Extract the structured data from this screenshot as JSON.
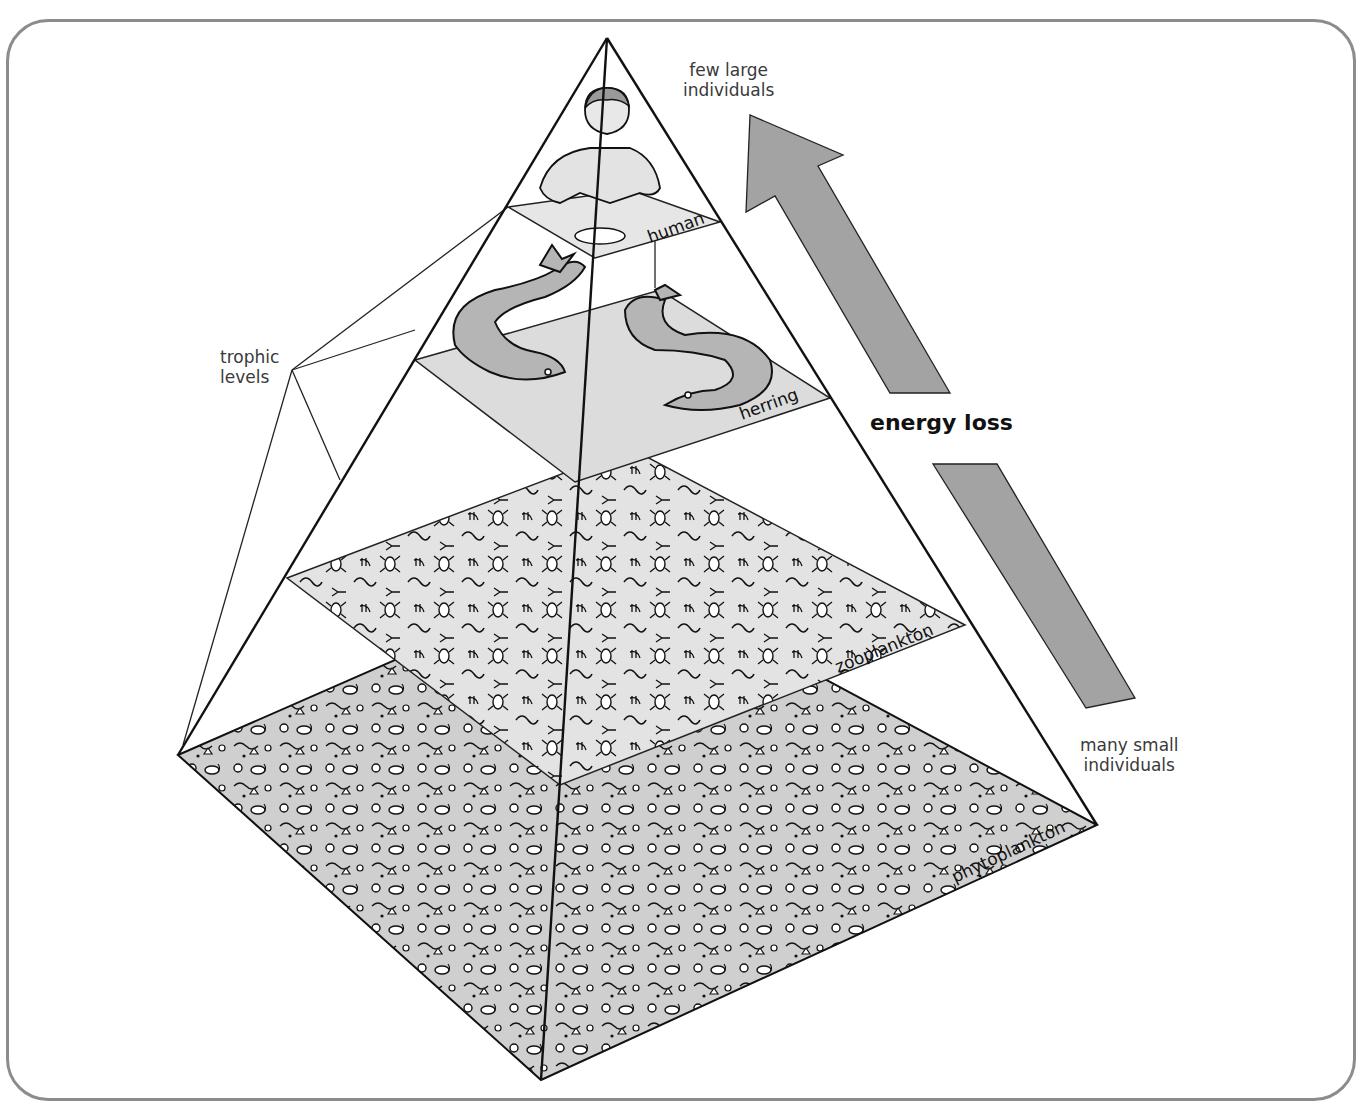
{
  "figure": {
    "frame_color": "#8c8c8c"
  },
  "labels": {
    "top_note": "few large individuals",
    "top_note_line1": "few large",
    "top_note_line2": "individuals",
    "bottom_note_line1": "many small",
    "bottom_note_line2": "individuals",
    "trophic_line1": "trophic",
    "trophic_line2": "levels",
    "energy_loss": "energy loss"
  },
  "levels": [
    {
      "id": "human",
      "label": "human",
      "order": 4,
      "fill": "#e6e6e6"
    },
    {
      "id": "herring",
      "label": "herring",
      "order": 3,
      "fill": "#dcdcdc"
    },
    {
      "id": "zooplankton",
      "label": "zooplankton",
      "order": 2,
      "fill": "#e3e3e3"
    },
    {
      "id": "phytoplankton",
      "label": "phytoplankton",
      "order": 1,
      "fill": "#cfcfcf"
    }
  ],
  "colors": {
    "arrow_fill": "#a3a3a3",
    "outline": "#111111",
    "fish_fill": "#b5b5b5"
  }
}
